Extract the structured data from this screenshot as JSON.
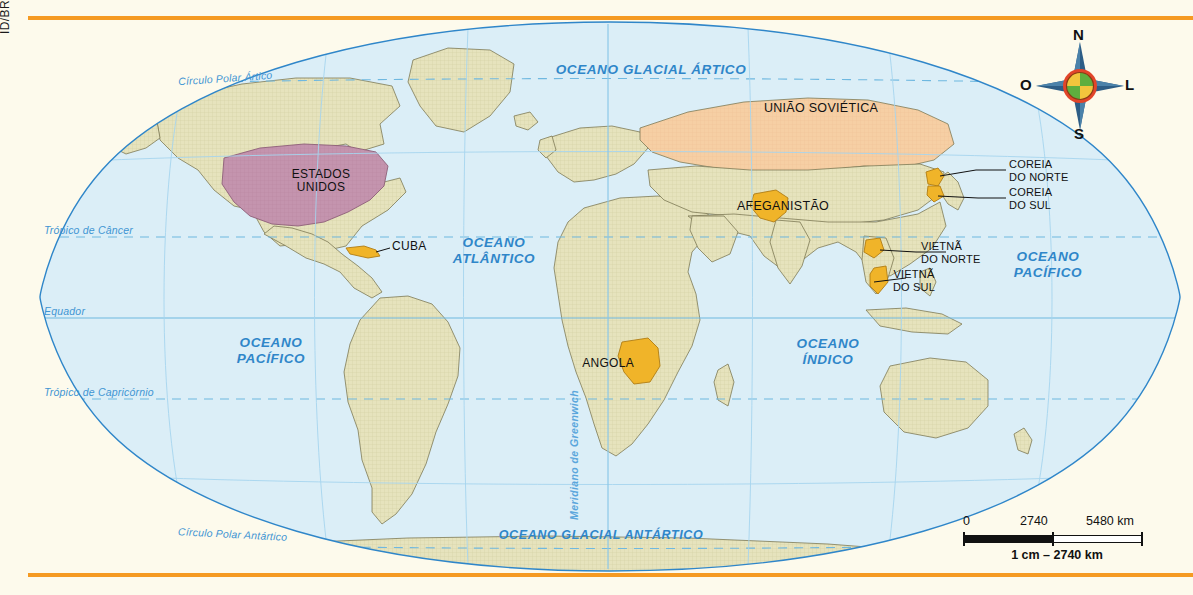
{
  "credit": "ID/BR",
  "map": {
    "title_absent": true,
    "oceans": [
      {
        "name": "oceano-glacial-artico",
        "label": "OCEANO GLACIAL ÁRTICO",
        "x": 513,
        "y": 48,
        "w": 220
      },
      {
        "name": "oceano-atlantico",
        "label": "OCEANO\nATLÂNTICO",
        "x": 396,
        "y": 222,
        "w": 140
      },
      {
        "name": "oceano-pacifico-oeste",
        "label": "OCEANO\nPACÍFICO",
        "x": 178,
        "y": 322,
        "w": 130
      },
      {
        "name": "oceano-indico",
        "label": "OCEANO\nÍNDICO",
        "x": 735,
        "y": 323,
        "w": 130
      },
      {
        "name": "oceano-pacifico-leste",
        "label": "OCEANO\nPACÍFICO",
        "x": 955,
        "y": 236,
        "w": 130
      },
      {
        "name": "oceano-glacial-antartico",
        "label": "OCEANO GLACIAL ANTÁRTICO",
        "x": 448,
        "y": 513,
        "w": 250
      }
    ],
    "parallels": [
      {
        "name": "circulo-polar-artico",
        "label": "Círculo Polar Ártico",
        "x": 150,
        "y": 63,
        "style": "dashed"
      },
      {
        "name": "tropico-de-cancer",
        "label": "Trópico de Câncer",
        "x": 42,
        "y": 212,
        "style": "dashed"
      },
      {
        "name": "equador",
        "label": "Equador",
        "x": 42,
        "y": 293,
        "style": "solid"
      },
      {
        "name": "tropico-de-capricornio",
        "label": "Trópico de Capricórnio",
        "x": 42,
        "y": 374,
        "style": "dashed"
      },
      {
        "name": "circulo-polar-antartico",
        "label": "Círculo Polar Antártico",
        "x": 150,
        "y": 516,
        "style": "dashed"
      }
    ],
    "meridian": {
      "name": "meridiano-de-greenwich",
      "label": "Meridiano de Greenwich",
      "x": 548,
      "y": 500
    },
    "countries": [
      {
        "name": "estados-unidos",
        "label": "ESTADOS\nUNIDOS",
        "x": 238,
        "y": 155,
        "w": 110,
        "color": "#c494ae"
      },
      {
        "name": "cuba",
        "label": "CUBA",
        "x": 364,
        "y": 226,
        "w": 44,
        "color": "#f0b429"
      },
      {
        "name": "uniao-sovietica",
        "label": "UNIÃO SOVIÉTICA",
        "x": 728,
        "y": 88,
        "w": 130,
        "color": "#f6cfa4"
      },
      {
        "name": "afeganistao",
        "label": "AFEGANISTÃO",
        "x": 712,
        "y": 186,
        "w": 96,
        "color": "#f0b429"
      },
      {
        "name": "angola",
        "label": "ANGOLA",
        "x": 580,
        "y": 343,
        "w": 58,
        "color": "#f0b429"
      },
      {
        "name": "vietna-do-sul",
        "label": "VIETNÃ\nDO SUL",
        "x": 884,
        "y": 252,
        "w": 56,
        "color": "#f0b429"
      }
    ],
    "callouts": [
      {
        "name": "coreia-do-norte",
        "label": "COREIA\nDO NORTE",
        "x": 985,
        "y": 146
      },
      {
        "name": "coreia-do-sul",
        "label": "COREIA\nDO SUL",
        "x": 985,
        "y": 174
      },
      {
        "name": "vietna-do-norte",
        "label": "VIETNÃ\nDO NORTE",
        "x": 925,
        "y": 226
      }
    ],
    "colors": {
      "sea": "#dbeef7",
      "land": "#e6e3bd",
      "land_outline": "#6b6b4a",
      "coast": "#2f86c9",
      "graticule": "#7fc0e4",
      "usa": "#c494ae",
      "ussr": "#f6cfa4",
      "highlight": "#f0b429",
      "rule": "#f59a22",
      "label_blue": "#2f86c9"
    }
  },
  "compass": {
    "north": "N",
    "south": "S",
    "west": "O",
    "east": "L",
    "ring_color": "#e2452a",
    "quad_yellow": "#f2c53d",
    "quad_green": "#5fae3e",
    "arrow_color": "#2d5d86"
  },
  "scale": {
    "zero": "0",
    "mid": "2740",
    "max": "5480 km",
    "equivalence": "1 cm – 2740 km"
  }
}
